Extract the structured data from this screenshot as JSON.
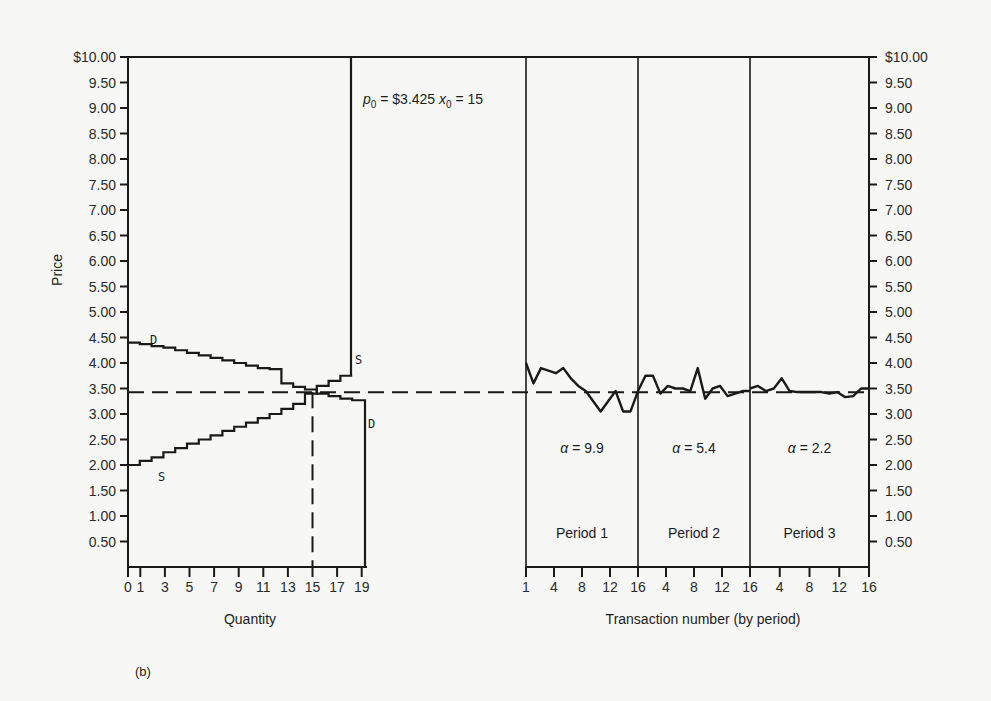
{
  "chart_data": {
    "type": "line",
    "title": "",
    "caption": "(b)",
    "annotation": {
      "p0_label": "p",
      "p0_sub": "0",
      "p0_value": " = $3.425 ",
      "x0_label": "x",
      "x0_sub": "0",
      "x0_value": " = 15"
    },
    "equilibrium_price": 3.425,
    "equilibrium_quantity": 15,
    "ylabel": "Price",
    "ylim": [
      0,
      10
    ],
    "y_ticks": [
      "$10.00",
      "9.50",
      "9.00",
      "8.50",
      "8.00",
      "7.50",
      "7.00",
      "6.50",
      "6.00",
      "5.50",
      "5.00",
      "4.50",
      "4.00",
      "3.50",
      "3.00",
      "2.50",
      "2.00",
      "1.50",
      "1.00",
      "0.50"
    ],
    "left_panel": {
      "xlabel": "Quantity",
      "x_ticks": [
        "0",
        "1",
        "3",
        "5",
        "7",
        "9",
        "11",
        "13",
        "15",
        "17",
        "19"
      ],
      "demand_label": "D",
      "supply_label": "S",
      "demand_steps": [
        4.4,
        4.37,
        4.33,
        4.3,
        4.25,
        4.2,
        4.15,
        4.1,
        4.05,
        4.0,
        3.95,
        3.9,
        3.88,
        3.6,
        3.53,
        3.48,
        3.4,
        3.35,
        3.3,
        3.27
      ],
      "supply_steps": [
        2.0,
        2.08,
        2.15,
        2.25,
        2.33,
        2.42,
        2.5,
        2.58,
        2.67,
        2.75,
        2.83,
        2.92,
        3.0,
        3.1,
        3.2,
        3.4,
        3.55,
        3.65,
        3.75,
        10.0
      ]
    },
    "right_panel": {
      "xlabel": "Transaction number (by period)",
      "x_ticks": [
        "1",
        "4",
        "8",
        "12",
        "16",
        "4",
        "8",
        "12",
        "16",
        "4",
        "8",
        "12",
        "16"
      ],
      "periods": [
        {
          "label": "Period    1",
          "alpha": "α = 9.9",
          "values": [
            4.0,
            3.6,
            3.9,
            3.85,
            3.8,
            3.9,
            3.7,
            3.55,
            3.45,
            3.25,
            3.05,
            3.25,
            3.45,
            3.05,
            3.05,
            3.45
          ]
        },
        {
          "label": "Period 2",
          "alpha": "α = 5.4",
          "values": [
            3.45,
            3.75,
            3.75,
            3.4,
            3.55,
            3.5,
            3.5,
            3.45,
            3.9,
            3.3,
            3.5,
            3.55,
            3.35,
            3.4,
            3.45,
            3.45
          ]
        },
        {
          "label": "Period 3",
          "alpha": "α = 2.2",
          "values": [
            3.5,
            3.55,
            3.45,
            3.5,
            3.7,
            3.45,
            3.43,
            3.43,
            3.43,
            3.43,
            3.4,
            3.43,
            3.33,
            3.35,
            3.5,
            3.5
          ]
        }
      ]
    },
    "right_ylabel_ticks": [
      "$10.00",
      "9.50",
      "9.00",
      "8.50",
      "8.00",
      "7.50",
      "7.00",
      "6.50",
      "6.00",
      "5.50",
      "5.00",
      "4.50",
      "4.00",
      "3.50",
      "3.00",
      "2.50",
      "2.00",
      "1.50",
      "1.00",
      "0.50"
    ]
  }
}
